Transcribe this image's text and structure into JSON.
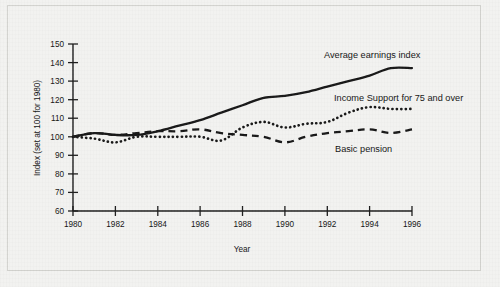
{
  "chart_data": {
    "type": "line",
    "title": "",
    "xlabel": "Year",
    "ylabel": "Index (set at 100 for 1980)",
    "xlim": [
      1980,
      1996
    ],
    "ylim": [
      60,
      150
    ],
    "grid": false,
    "legend_position": "inline-annotations",
    "xticks": [
      "1980",
      "1982",
      "1984",
      "1986",
      "1988",
      "1990",
      "1992",
      "1994",
      "1996"
    ],
    "yticks": [
      "60",
      "70",
      "80",
      "90",
      "100",
      "110",
      "120",
      "130",
      "140",
      "150"
    ],
    "x": [
      1980,
      1981,
      1982,
      1983,
      1984,
      1985,
      1986,
      1987,
      1988,
      1989,
      1990,
      1991,
      1992,
      1993,
      1994,
      1995,
      1996
    ],
    "series": [
      {
        "name": "Average earnings index",
        "style": "solid",
        "values": [
          100,
          102,
          101,
          101,
          103,
          106,
          109,
          113,
          117,
          121,
          122,
          124,
          127,
          130,
          133,
          137,
          137
        ]
      },
      {
        "name": "Income Support for 75 and over",
        "style": "dotted",
        "values": [
          100,
          99,
          97,
          100,
          100,
          100,
          100,
          98,
          105,
          108,
          105,
          107,
          108,
          113,
          116,
          115,
          115
        ]
      },
      {
        "name": "Basic pension",
        "style": "dashed",
        "values": [
          100,
          102,
          101,
          102,
          103,
          103,
          104,
          102,
          101,
          100,
          97,
          100,
          102,
          103,
          104,
          102,
          104
        ]
      }
    ],
    "annotations": [
      {
        "text": "Average earnings index",
        "series": "Average earnings index"
      },
      {
        "text": "Income Support for 75 and over",
        "series": "Income Support for 75 and over"
      },
      {
        "text": "Basic pension",
        "series": "Basic pension"
      }
    ]
  }
}
